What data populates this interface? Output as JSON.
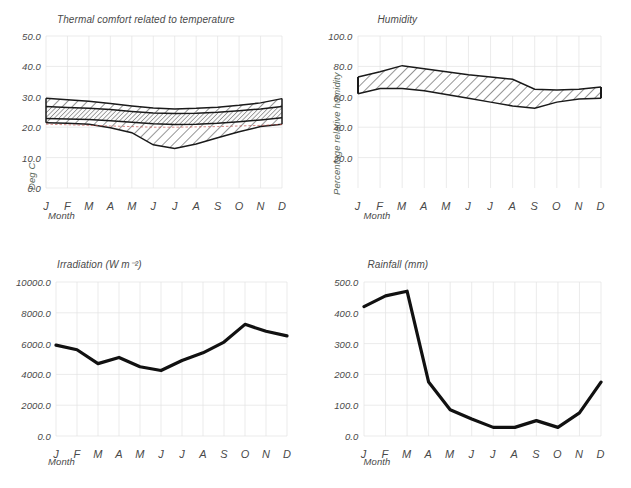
{
  "figure": {
    "months": [
      "J",
      "F",
      "M",
      "A",
      "M",
      "J",
      "J",
      "A",
      "S",
      "O",
      "N",
      "D"
    ],
    "xlabel": "Month"
  },
  "chart_data": [
    {
      "id": "thermal",
      "type": "area",
      "title": "Thermal comfort related to temperature",
      "xlabel": "Month",
      "ylabel": "Deg C",
      "categories": [
        "J",
        "F",
        "M",
        "A",
        "M",
        "J",
        "J",
        "A",
        "S",
        "O",
        "N",
        "D"
      ],
      "ylim": [
        0,
        50
      ],
      "yticks": [
        "0.0",
        "10.0",
        "20.0",
        "30.0",
        "40.0",
        "50.0"
      ],
      "grid": true,
      "legend": "none",
      "series": [
        {
          "name": "Upper comfort limit",
          "values": [
            29.5,
            29.0,
            28.5,
            27.8,
            27.0,
            26.3,
            26.0,
            26.2,
            26.6,
            27.2,
            28.0,
            29.4
          ]
        },
        {
          "name": "Upper neutral",
          "values": [
            26.8,
            26.5,
            26.2,
            25.8,
            25.2,
            24.7,
            24.5,
            24.6,
            24.9,
            25.4,
            26.0,
            26.8
          ]
        },
        {
          "name": "Lower neutral",
          "values": [
            22.9,
            22.7,
            22.5,
            22.1,
            21.6,
            21.1,
            20.9,
            21.0,
            21.3,
            21.8,
            22.4,
            23.1
          ]
        },
        {
          "name": "Lower comfort limit",
          "values": [
            21.5,
            21.3,
            21.0,
            19.8,
            18.2,
            14.2,
            13.0,
            14.5,
            16.5,
            18.5,
            20.2,
            21.0
          ]
        },
        {
          "name": "Neutral temperature",
          "values": [
            21.0,
            20.8,
            20.6,
            20.4,
            20.2,
            20.0,
            20.0,
            20.1,
            20.2,
            20.4,
            20.6,
            20.9
          ]
        }
      ]
    },
    {
      "id": "humidity",
      "type": "area",
      "title": "Humidity",
      "xlabel": "Month",
      "ylabel": "Percentage relative humidity",
      "categories": [
        "J",
        "F",
        "M",
        "A",
        "M",
        "J",
        "J",
        "A",
        "S",
        "O",
        "N",
        "D"
      ],
      "ylim": [
        0,
        100
      ],
      "yticks": [
        "20.0",
        "40.0",
        "60.0",
        "80.0",
        "100.0"
      ],
      "grid": true,
      "legend": "none",
      "series": [
        {
          "name": "Maximum relative humidity",
          "values": [
            73.0,
            76.5,
            80.5,
            78.5,
            76.5,
            74.5,
            73.0,
            71.5,
            65.0,
            64.5,
            65.0,
            66.5
          ]
        },
        {
          "name": "Minimum relative humidity",
          "values": [
            62.0,
            65.5,
            65.5,
            64.0,
            61.5,
            59.0,
            56.5,
            54.0,
            52.5,
            56.5,
            58.5,
            59.0
          ]
        }
      ]
    },
    {
      "id": "irradiation",
      "type": "line",
      "title": "Irradiation  (W m⁻²)",
      "xlabel": "Month",
      "ylabel": "",
      "categories": [
        "J",
        "F",
        "M",
        "A",
        "M",
        "J",
        "J",
        "A",
        "S",
        "O",
        "N",
        "D"
      ],
      "ylim": [
        0,
        10000
      ],
      "yticks": [
        "0.0",
        "2000.0",
        "4000.0",
        "6000.0",
        "8000.0",
        "10000.0"
      ],
      "grid": true,
      "legend": "none",
      "series": [
        {
          "name": "Irradiation",
          "values": [
            5900,
            5600,
            4700,
            5100,
            4500,
            4250,
            4900,
            5400,
            6100,
            7250,
            6800,
            6500
          ]
        }
      ]
    },
    {
      "id": "rainfall",
      "type": "line",
      "title": "Rainfall  (mm)",
      "xlabel": "Month",
      "ylabel": "",
      "categories": [
        "J",
        "F",
        "M",
        "A",
        "M",
        "J",
        "J",
        "A",
        "S",
        "O",
        "N",
        "D"
      ],
      "ylim": [
        0,
        500
      ],
      "yticks": [
        "0.0",
        "100.0",
        "200.0",
        "300.0",
        "400.0",
        "500.0"
      ],
      "grid": true,
      "legend": "none",
      "series": [
        {
          "name": "Rainfall",
          "values": [
            420,
            455,
            470,
            175,
            85,
            55,
            28,
            28,
            50,
            28,
            75,
            175
          ]
        }
      ]
    }
  ]
}
